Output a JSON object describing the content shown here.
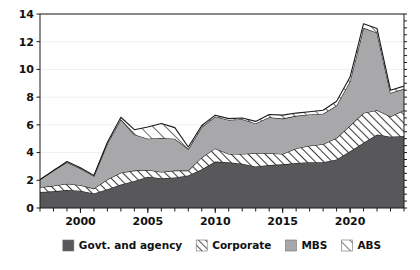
{
  "chart_data": {
    "type": "area",
    "title": "",
    "subtitle": "",
    "xlabel": "",
    "ylabel": "",
    "stacked": true,
    "grid": true,
    "legend_position": "bottom",
    "xlim": [
      1997,
      2024
    ],
    "ylim": [
      0,
      14
    ],
    "y_ticks": [
      0,
      2,
      4,
      6,
      8,
      10,
      12,
      14
    ],
    "y_tick_labels": [
      "0",
      "2",
      "4",
      "6",
      "8",
      "10",
      "12",
      "14"
    ],
    "x_ticks": [
      2000,
      2005,
      2010,
      2015,
      2020
    ],
    "x_tick_labels": [
      "2000",
      "2005",
      "2010",
      "2015",
      "2020"
    ],
    "x_minor_tick_interval": 1,
    "x": [
      1997,
      1998,
      1999,
      2000,
      2001,
      2002,
      2003,
      2004,
      2005,
      2006,
      2007,
      2008,
      2009,
      2010,
      2011,
      2012,
      2013,
      2014,
      2015,
      2016,
      2017,
      2018,
      2019,
      2020,
      2021,
      2022,
      2023,
      2024
    ],
    "series": [
      {
        "name": "Govt. and agency",
        "pattern": "solid",
        "color": "#58585a",
        "values": [
          1.15,
          1.2,
          1.3,
          1.25,
          1.05,
          1.35,
          1.7,
          1.95,
          2.25,
          2.15,
          2.2,
          2.35,
          2.8,
          3.35,
          3.3,
          3.2,
          3.0,
          3.1,
          3.15,
          3.25,
          3.3,
          3.3,
          3.5,
          4.1,
          4.7,
          5.3,
          5.15,
          5.2
        ]
      },
      {
        "name": "Corporate",
        "pattern": "hatch-dense",
        "color": "#ffffff",
        "values": [
          0.35,
          0.4,
          0.45,
          0.4,
          0.35,
          0.7,
          0.85,
          0.75,
          0.5,
          0.45,
          0.5,
          0.35,
          0.85,
          0.95,
          0.6,
          0.7,
          0.95,
          0.85,
          0.75,
          1.05,
          1.2,
          1.3,
          1.55,
          1.85,
          2.15,
          1.75,
          1.45,
          1.85
        ]
      },
      {
        "name": "MBS",
        "pattern": "solid",
        "color": "#a8a8aa",
        "values": [
          0.55,
          1.1,
          1.55,
          1.2,
          0.9,
          2.6,
          3.85,
          2.6,
          2.25,
          2.45,
          2.3,
          1.55,
          2.2,
          2.3,
          2.45,
          2.5,
          2.15,
          2.6,
          2.55,
          2.35,
          2.25,
          2.2,
          2.35,
          3.2,
          6.15,
          5.6,
          1.7,
          1.55
        ]
      },
      {
        "name": "ABS",
        "pattern": "hatch-sparse",
        "color": "#ffffff",
        "values": [
          0.0,
          0.0,
          0.05,
          0.05,
          0.05,
          0.1,
          0.15,
          0.35,
          0.85,
          1.05,
          0.8,
          0.15,
          0.1,
          0.1,
          0.1,
          0.1,
          0.15,
          0.2,
          0.25,
          0.2,
          0.2,
          0.25,
          0.3,
          0.3,
          0.3,
          0.3,
          0.2,
          0.2
        ]
      }
    ],
    "totals": [
      2.05,
      2.7,
      3.35,
      2.9,
      2.35,
      4.75,
      6.55,
      5.65,
      5.85,
      6.1,
      5.8,
      4.4,
      5.95,
      6.7,
      6.45,
      6.5,
      6.25,
      6.75,
      6.7,
      6.85,
      6.95,
      7.05,
      7.7,
      9.45,
      13.3,
      12.95,
      8.5,
      8.8
    ]
  },
  "legend": {
    "items": [
      {
        "label": "Govt. and agency",
        "swatch": "solid-dark"
      },
      {
        "label": "Corporate",
        "swatch": "hatch-dense"
      },
      {
        "label": "MBS",
        "swatch": "solid-mid"
      },
      {
        "label": "ABS",
        "swatch": "hatch-sparse"
      }
    ]
  },
  "colors": {
    "govt": "#58585a",
    "mbs": "#a8a8aa",
    "hatch_stroke": "#3c3c3e",
    "outline": "#1a1a1a",
    "grid": "#f0f0f2",
    "background": "#ffffff",
    "text": "#111111"
  }
}
